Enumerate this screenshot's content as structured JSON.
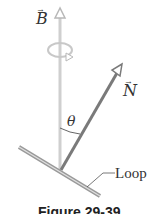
{
  "figure": {
    "labels": {
      "b_vector": "B",
      "n_vector": "N",
      "angle": "θ",
      "loop": "Loop",
      "vector_arrow": "→"
    },
    "caption": "Figure 29-39",
    "colors": {
      "b_arrow": "#c8c8c8",
      "n_arrow": "#7a7a7a",
      "loop_plate": "#9a9a9a",
      "text": "#333333"
    }
  }
}
